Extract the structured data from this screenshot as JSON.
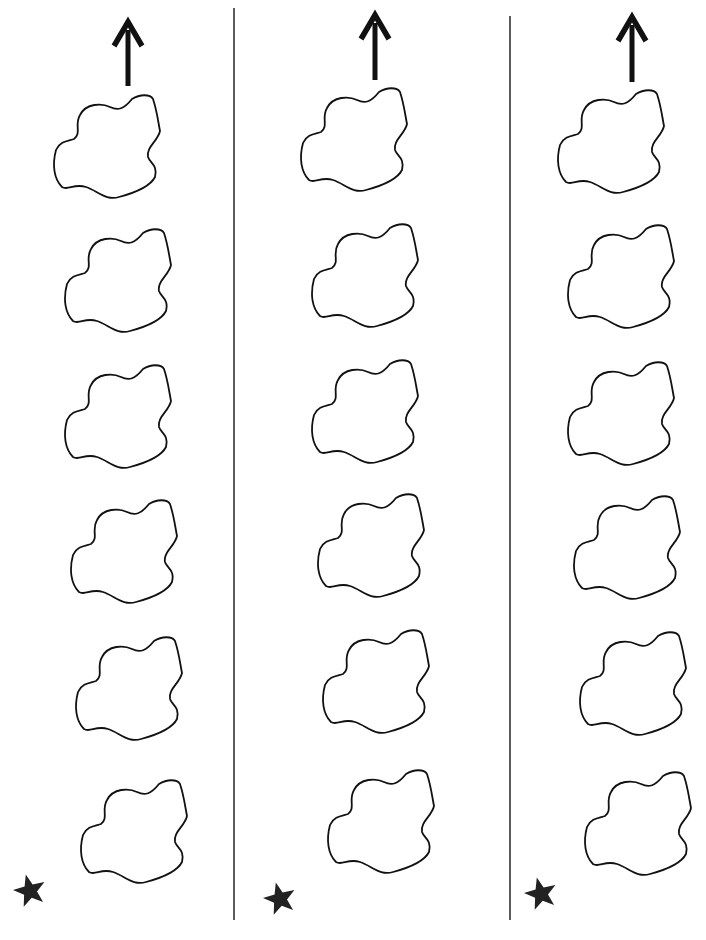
{
  "worksheet": {
    "description": "Three columns, each with an up arrow, six blob shapes stacked vertically, and a star at the bottom-left",
    "colors": {
      "ink": "#111111",
      "divider": "#333333",
      "star": "#222222",
      "background": "#ffffff"
    },
    "dividers": [
      {
        "x": 234,
        "y1": 8,
        "y2": 920
      },
      {
        "x": 510,
        "y1": 16,
        "y2": 920
      }
    ],
    "columns": [
      {
        "arrow": {
          "x": 128,
          "top": 22,
          "bottom": 86,
          "icon": "arrow-up-icon"
        },
        "blobs": [
          {
            "x": 54,
            "y": 95
          },
          {
            "x": 65,
            "y": 229
          },
          {
            "x": 65,
            "y": 365
          },
          {
            "x": 71,
            "y": 500
          },
          {
            "x": 76,
            "y": 637
          },
          {
            "x": 81,
            "y": 780
          }
        ],
        "star": {
          "x": 30,
          "y": 891,
          "icon": "star-icon"
        }
      },
      {
        "arrow": {
          "x": 375,
          "top": 15,
          "bottom": 80,
          "icon": "arrow-up-icon"
        },
        "blobs": [
          {
            "x": 301,
            "y": 88
          },
          {
            "x": 312,
            "y": 224
          },
          {
            "x": 312,
            "y": 360
          },
          {
            "x": 318,
            "y": 494
          },
          {
            "x": 323,
            "y": 630
          },
          {
            "x": 328,
            "y": 770
          }
        ],
        "star": {
          "x": 280,
          "y": 899,
          "icon": "star-icon"
        }
      },
      {
        "arrow": {
          "x": 632,
          "top": 17,
          "bottom": 82,
          "icon": "arrow-up-icon"
        },
        "blobs": [
          {
            "x": 558,
            "y": 90
          },
          {
            "x": 568,
            "y": 225
          },
          {
            "x": 568,
            "y": 362
          },
          {
            "x": 574,
            "y": 496
          },
          {
            "x": 580,
            "y": 632
          },
          {
            "x": 585,
            "y": 772
          }
        ],
        "star": {
          "x": 541,
          "y": 894,
          "icon": "star-icon"
        }
      }
    ]
  }
}
